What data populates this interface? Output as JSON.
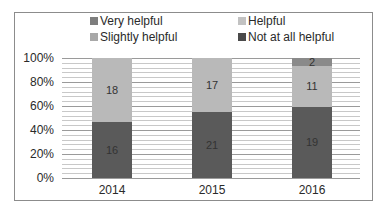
{
  "chart_data": {
    "type": "bar",
    "stacked": true,
    "normalized": true,
    "title": "",
    "xlabel": "",
    "ylabel": "",
    "categories": [
      "2014",
      "2015",
      "2016"
    ],
    "series": [
      {
        "name": "Not at all helpful",
        "color": "#5a5a5a",
        "values": [
          16,
          21,
          19
        ]
      },
      {
        "name": "Helpful",
        "color": "#b9b9b9",
        "values": [
          18,
          17,
          11
        ]
      },
      {
        "name": "Slightly helpful",
        "color": "#a4a4a4",
        "values": [
          0,
          0,
          0
        ]
      },
      {
        "name": "Very helpful",
        "color": "#8a8a8a",
        "values": [
          0,
          0,
          2
        ]
      }
    ],
    "yticks": [
      "0%",
      "20%",
      "40%",
      "60%",
      "80%",
      "100%"
    ],
    "ylim": [
      0,
      100
    ],
    "grid": true,
    "legend_position": "top",
    "legend": [
      "Very helpful",
      "Helpful",
      "Slightly helpful",
      "Not at all helpful"
    ]
  },
  "legend": {
    "items": [
      {
        "label": "Very helpful",
        "color": "#7e7e7e"
      },
      {
        "label": "Helpful",
        "color": "#c2c2c2"
      },
      {
        "label": "Slightly helpful",
        "color": "#a8a8a8"
      },
      {
        "label": "Not at all helpful",
        "color": "#4a4a4a"
      }
    ]
  },
  "axis": {
    "y_ticks": [
      "0%",
      "20%",
      "40%",
      "60%",
      "80%",
      "100%"
    ],
    "x_ticks": [
      "2014",
      "2015",
      "2016"
    ]
  },
  "bars": [
    {
      "year": "2014",
      "segments": [
        {
          "label": "16",
          "pct": 47.06,
          "color": "#5a5a5a"
        },
        {
          "label": "18",
          "pct": 52.94,
          "color": "#b9b9b9"
        }
      ]
    },
    {
      "year": "2015",
      "segments": [
        {
          "label": "21",
          "pct": 55.26,
          "color": "#5a5a5a"
        },
        {
          "label": "17",
          "pct": 44.74,
          "color": "#b9b9b9"
        }
      ]
    },
    {
      "year": "2016",
      "segments": [
        {
          "label": "19",
          "pct": 59.38,
          "color": "#5a5a5a"
        },
        {
          "label": "11",
          "pct": 34.37,
          "color": "#b9b9b9"
        },
        {
          "label": "2",
          "pct": 6.25,
          "color": "#8a8a8a"
        }
      ]
    }
  ]
}
